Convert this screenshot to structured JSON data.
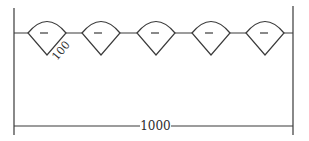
{
  "diagram": {
    "type": "dimensioned-layout",
    "colors": {
      "line": "#3a3a3a",
      "text": "#2b2b2b",
      "background": "#ffffff"
    },
    "total_span_label": "1000",
    "element_size_label": "100",
    "element_count": 5,
    "element_symbol": "−",
    "elements": [
      {
        "id": 1,
        "cx": 47,
        "symbol": "−"
      },
      {
        "id": 2,
        "cx": 101,
        "symbol": "−"
      },
      {
        "id": 3,
        "cx": 156,
        "symbol": "−"
      },
      {
        "id": 4,
        "cx": 211,
        "symbol": "−"
      },
      {
        "id": 5,
        "cx": 265,
        "symbol": "−"
      }
    ]
  }
}
